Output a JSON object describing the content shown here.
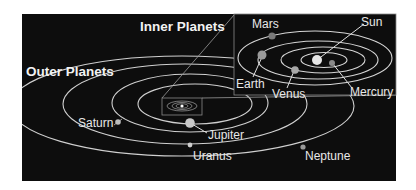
{
  "titles": {
    "inner": "Inner Planets",
    "outer": "Outer Planets"
  },
  "inner_planets": [
    {
      "name": "Sun",
      "type": "star"
    },
    {
      "name": "Mercury",
      "type": "planet"
    },
    {
      "name": "Venus",
      "type": "planet"
    },
    {
      "name": "Earth",
      "type": "planet"
    },
    {
      "name": "Mars",
      "type": "planet"
    }
  ],
  "outer_planets": [
    {
      "name": "Jupiter",
      "type": "planet"
    },
    {
      "name": "Saturn",
      "type": "planet"
    },
    {
      "name": "Uranus",
      "type": "planet"
    },
    {
      "name": "Neptune",
      "type": "planet"
    }
  ],
  "colors": {
    "background": "#0d0d0d",
    "orbit": "#d9d9d9",
    "text": "#e8e8e8"
  }
}
